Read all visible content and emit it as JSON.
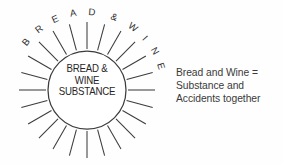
{
  "figure": {
    "background_color": "#fefefe",
    "ink_color": "#3c3c3c"
  },
  "sun": {
    "center_x": 87,
    "center_y": 90,
    "core_radius": 39,
    "ray_count": 24,
    "ray_inner_radius": 41,
    "ray_outer_radius": 68,
    "core_label": {
      "line1": "BREAD &",
      "line2": "WINE",
      "line3": "SUBSTANCE"
    },
    "arc_label": {
      "text": "BREAD & WINE",
      "letters": [
        "B",
        "R",
        "E",
        "A",
        "D",
        "&",
        "W",
        "I",
        "N",
        "E"
      ]
    }
  },
  "caption": {
    "line1": "Bread and Wine =",
    "line2": "Substance and",
    "line3": "Accidents together"
  }
}
